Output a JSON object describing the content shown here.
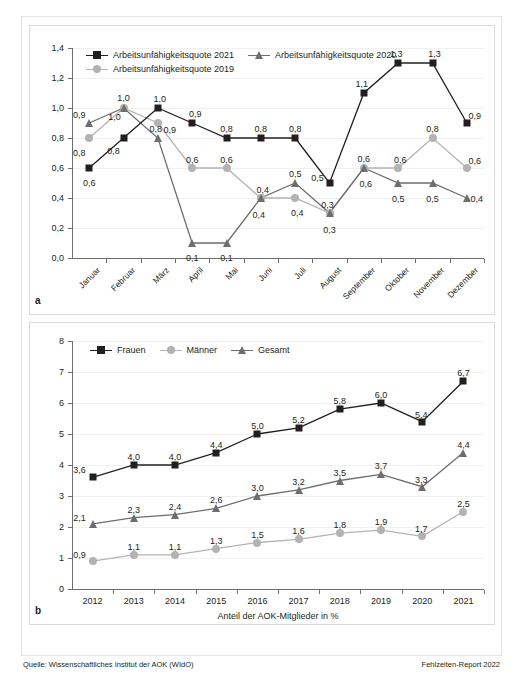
{
  "figure": {
    "panel_a_letter": "a",
    "panel_b_letter": "b",
    "source_note": "Quelle: Wissenschaftliches Institut der AOK (WIdO)",
    "report_note": "Fehlzeiten-Report 2022"
  },
  "colors": {
    "series_2021": "#231f20",
    "series_2020": "#6e6e6e",
    "series_2019": "#b3b3b3",
    "frauen": "#231f20",
    "gesamt": "#6e6e6e",
    "maenner": "#b3b3b3",
    "axis": "#6d6e71",
    "grid": "#f0f0f0",
    "panel_border": "#d9d9d9",
    "outer_border": "#e3e3e3",
    "text": "#231f20"
  },
  "chart_data": [
    {
      "type": "line",
      "id": "panel-a",
      "title": "",
      "xlabel": "",
      "ylabel": "",
      "ylim": [
        0.0,
        1.4
      ],
      "yticks": [
        "0,0",
        "0,2",
        "0,4",
        "0,6",
        "0,8",
        "1,0",
        "1,2",
        "1,4"
      ],
      "ytick_values": [
        0.0,
        0.2,
        0.4,
        0.6,
        0.8,
        1.0,
        1.2,
        1.4
      ],
      "grid": true,
      "legend_position": "top-left",
      "categories": [
        "Januar",
        "Februar",
        "März",
        "April",
        "Mai",
        "Juni",
        "Juli",
        "August",
        "September",
        "Oktober",
        "November",
        "Dezember"
      ],
      "series": [
        {
          "name": "Arbeitsunfähigkeitsquote 2021",
          "marker": "square",
          "color": "#231f20",
          "values": [
            0.6,
            0.8,
            1.0,
            0.9,
            0.8,
            0.8,
            0.8,
            0.5,
            1.1,
            1.3,
            1.3,
            0.9
          ],
          "labels": [
            "0,6",
            "0,8",
            "1,0",
            "0,9",
            "0,8",
            "0,8",
            "0,8",
            "0,5",
            "1,1",
            "1,3",
            "1,3",
            "0,9"
          ]
        },
        {
          "name": "Arbeitsunfähigkeitsquote 2020",
          "marker": "triangle",
          "color": "#6e6e6e",
          "values": [
            0.9,
            1.0,
            0.8,
            0.1,
            0.1,
            0.4,
            0.5,
            0.3,
            0.6,
            0.5,
            0.5,
            0.4
          ],
          "labels": [
            "0,9",
            "1,0",
            "0,8",
            "0,1",
            "0,1",
            "0,4",
            "0,5",
            "0,3",
            "0,6",
            "0,5",
            "0,5",
            "0,4"
          ]
        },
        {
          "name": "Arbeitsunfähigkeitsquote 2019",
          "marker": "circle",
          "color": "#b3b3b3",
          "values": [
            0.8,
            1.0,
            0.9,
            0.6,
            0.6,
            0.4,
            0.4,
            0.3,
            0.6,
            0.6,
            0.8,
            0.6
          ],
          "labels": [
            "0,8",
            "1,0",
            "0,9",
            "0,6",
            "0,6",
            "0,4",
            "0,4",
            "0,3",
            "0,6",
            "0,6",
            "0,8",
            "0,6"
          ]
        }
      ]
    },
    {
      "type": "line",
      "id": "panel-b",
      "title": "",
      "xlabel": "Anteil der AOK-Mitglieder in %",
      "ylabel": "",
      "ylim": [
        0,
        8
      ],
      "yticks": [
        "0",
        "1",
        "2",
        "3",
        "4",
        "5",
        "6",
        "7",
        "8"
      ],
      "ytick_values": [
        0,
        1,
        2,
        3,
        4,
        5,
        6,
        7,
        8
      ],
      "grid": true,
      "legend_position": "top-left",
      "categories": [
        "2012",
        "2013",
        "2014",
        "2015",
        "2016",
        "2017",
        "2018",
        "2019",
        "2020",
        "2021"
      ],
      "series": [
        {
          "name": "Frauen",
          "marker": "square",
          "color": "#231f20",
          "values": [
            3.6,
            4.0,
            4.0,
            4.4,
            5.0,
            5.2,
            5.8,
            6.0,
            5.4,
            6.7
          ],
          "labels": [
            "3,6",
            "4,0",
            "4,0",
            "4,4",
            "5,0",
            "5,2",
            "5,8",
            "6,0",
            "5,4",
            "6,7"
          ]
        },
        {
          "name": "Männer",
          "marker": "circle",
          "color": "#b3b3b3",
          "values": [
            0.9,
            1.1,
            1.1,
            1.3,
            1.5,
            1.6,
            1.8,
            1.9,
            1.7,
            2.5
          ],
          "labels": [
            "0,9",
            "1,1",
            "1,1",
            "1,3",
            "1,5",
            "1,6",
            "1,8",
            "1,9",
            "1,7",
            "2,5"
          ]
        },
        {
          "name": "Gesamt",
          "marker": "triangle",
          "color": "#6e6e6e",
          "values": [
            2.1,
            2.3,
            2.4,
            2.6,
            3.0,
            3.2,
            3.5,
            3.7,
            3.3,
            4.4
          ],
          "labels": [
            "2,1",
            "2,3",
            "2,4",
            "2,6",
            "3,0",
            "3,2",
            "3,5",
            "3,7",
            "3,3",
            "4,4"
          ]
        }
      ]
    }
  ]
}
